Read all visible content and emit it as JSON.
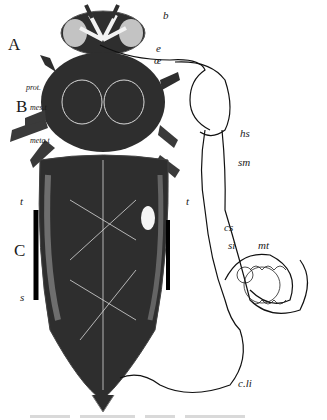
{
  "figure": {
    "colors": {
      "body_dark": "#2e2e2e",
      "tube_outline": "#111111",
      "background": "#ffffff",
      "veins": "#d8d8d8"
    },
    "regions": [
      {
        "id": "A",
        "label": "A",
        "meaning": "head"
      },
      {
        "id": "B",
        "label": "B",
        "meaning": "thorax"
      },
      {
        "id": "C",
        "label": "C",
        "meaning": "abdomen"
      }
    ],
    "labels": {
      "A": "A",
      "B": "B",
      "C": "C",
      "b": "b",
      "e": "e",
      "oe": "œ",
      "prot": "prot.",
      "mest": "mes.t",
      "metat": "meta.t",
      "hs": "hs",
      "sm": "sm",
      "t_left": "t",
      "t_right": "t",
      "cs": "cs",
      "si": "si",
      "mt": "mt",
      "s": "s",
      "cli": "c.li"
    },
    "caption_visible": false
  }
}
